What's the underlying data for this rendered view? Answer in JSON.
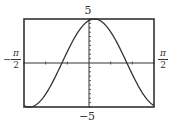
{
  "chart_data": {
    "type": "line",
    "title": "",
    "xlabel": "",
    "ylabel": "",
    "xlim": [
      -1.5708,
      1.5708
    ],
    "ylim": [
      -5,
      5
    ],
    "grid": false,
    "legend": null,
    "x_tick_labels": {
      "left": "−π/2",
      "right": "π/2"
    },
    "y_tick_labels": {
      "top": "5",
      "bottom": "−5"
    },
    "x_ticks_count_each_side": 3,
    "y_ticks_count_each_side": 10,
    "series": [
      {
        "name": "y = 5cos(2x − π/12)",
        "function": "5*cos(2*x - pi/12)",
        "amplitude": 5,
        "frequency": 2,
        "phase": 0.2618,
        "sample_points": [
          {
            "x": -1.5708,
            "y": -4.83
          },
          {
            "x": -1.1781,
            "y": -3.97
          },
          {
            "x": -0.7854,
            "y": -1.29
          },
          {
            "x": -0.3927,
            "y": 1.29
          },
          {
            "x": 0.0,
            "y": 4.83
          },
          {
            "x": 0.1309,
            "y": 5.0
          },
          {
            "x": 0.3927,
            "y": 3.97
          },
          {
            "x": 0.7854,
            "y": 1.29
          },
          {
            "x": 1.1781,
            "y": -1.29
          },
          {
            "x": 1.5708,
            "y": -4.83
          }
        ]
      }
    ],
    "frame": {
      "left_px": 24,
      "right_px": 154,
      "top_px": 19,
      "bottom_px": 107
    },
    "colors": {
      "frame": "#333333",
      "axis": "#333333",
      "curve": "#333333",
      "background": "#ffffff"
    }
  },
  "labels": {
    "y_top": "5",
    "y_bottom": "−5",
    "x_left_sign": "−",
    "x_left_num": "π",
    "x_left_den": "2",
    "x_right_num": "π",
    "x_right_den": "2"
  }
}
